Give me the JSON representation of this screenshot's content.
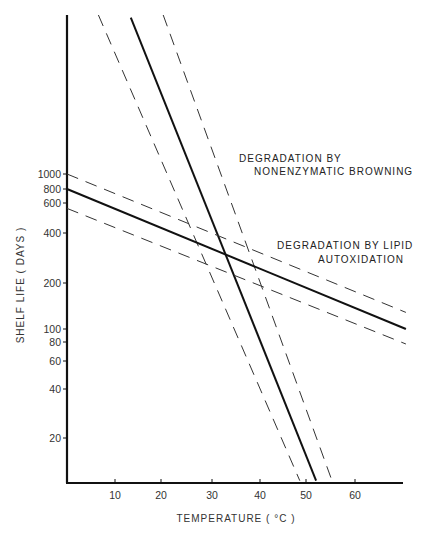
{
  "chart_data": {
    "type": "line",
    "title": "",
    "xlabel": "TEMPERATURE (°C)",
    "ylabel": "SHELF LIFE (DAYS)",
    "xscale": "linear",
    "yscale": "log",
    "xlim": [
      0,
      70
    ],
    "ylim": [
      10,
      10000
    ],
    "grid": false,
    "legend": null,
    "x_ticks": [
      10,
      20,
      30,
      40,
      50,
      60
    ],
    "y_ticks": [
      20,
      40,
      60,
      80,
      100,
      200,
      400,
      600,
      800,
      1000
    ],
    "series": [
      {
        "name": "Nonenzymatic browning",
        "style": "solid",
        "x": [
          13.3,
          51.9
        ],
        "y": [
          10200,
          10.5
        ]
      },
      {
        "name": "Nonenzymatic browning (lower bound)",
        "style": "dashed",
        "x": [
          6.5,
          48.5
        ],
        "y": [
          10700,
          10.5
        ]
      },
      {
        "name": "Nonenzymatic browning (upper bound)",
        "style": "dashed",
        "x": [
          20.0,
          55.2
        ],
        "y": [
          10700,
          10.5
        ]
      },
      {
        "name": "Lipid autoxidation",
        "style": "solid",
        "x": [
          0,
          70.6
        ],
        "y": [
          800,
          100
        ]
      },
      {
        "name": "Lipid autoxidation (upper bound)",
        "style": "dashed",
        "x": [
          0,
          70.6
        ],
        "y": [
          1000,
          128
        ]
      },
      {
        "name": "Lipid autoxidation (lower bound)",
        "style": "dashed",
        "x": [
          0,
          70.6
        ],
        "y": [
          600,
          80
        ]
      }
    ],
    "annotations": [
      {
        "text": [
          "DEGRADATION BY",
          "NONENZYMATIC BROWNING"
        ],
        "x": 238,
        "y": 160
      },
      {
        "text": [
          "DEGRADATION BY LIPID",
          "AUTOXIDATION"
        ],
        "x": 275,
        "y": 250
      }
    ]
  },
  "labels": {
    "xlabel": "TEMPERATURE ( °C )",
    "ylabel": "SHELF LIFE  ( DAYS )",
    "annot_browning_1": "DEGRADATION BY",
    "annot_browning_2": "NONENZYMATIC BROWNING",
    "annot_lipid_1": "DEGRADATION BY LIPID",
    "annot_lipid_2": "AUTOXIDATION"
  }
}
